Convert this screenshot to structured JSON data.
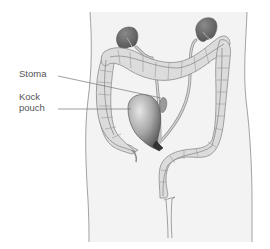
{
  "diagram": {
    "type": "anatomical",
    "labels": {
      "stoma": "Stoma",
      "kock_pouch_line1": "Kock",
      "kock_pouch_line2": "pouch"
    },
    "colors": {
      "body_fill": "#f2f2f2",
      "body_outline": "#888888",
      "colon_fill": "#dcdcdc",
      "colon_outline": "#8a8a8a",
      "kidney": "#6e6e6e",
      "pouch_light": "#cfcfcf",
      "pouch_dark": "#5a5a5a",
      "label_text": "#555555",
      "leader_line": "#777777"
    }
  }
}
